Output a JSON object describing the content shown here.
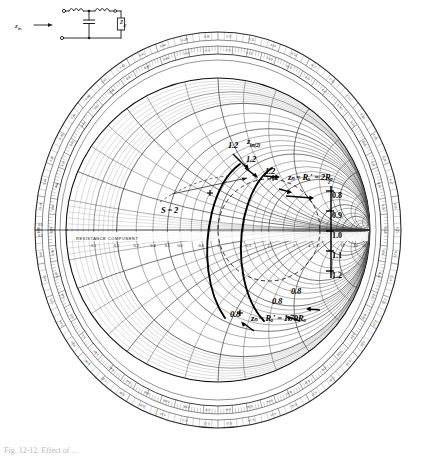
{
  "circuit": {
    "name": "two-section-lc-ladder",
    "input_label": "z",
    "input_sub": "in",
    "load_label": "z",
    "load_sub": "R",
    "components": [
      "inductor-1",
      "inductor-2",
      "capacitor-shunt",
      "load-resistor"
    ],
    "arrow": "input-direction-arrow"
  },
  "chart": {
    "type": "smith-chart",
    "title": "",
    "axis_label": "RESISTANCE COMPONENT",
    "left_rim_label_top": "0.0",
    "left_rim_label_bottom": "0.5",
    "grid_color": "#555555",
    "trace_color": "#000000",
    "rim_color": "#222222"
  },
  "annotations": {
    "swr_label": "S = 2",
    "freq_12_a": "1.2",
    "freq_12_b": "1.2",
    "freq_12_c": "1.2",
    "zin_2_label": "z",
    "zin_2_sub": "in(2)",
    "zin_2_right": "zₙ = Rₒ′ = 2Rₒ",
    "freq_08_a": "0.8",
    "freq_08_b": "0.8",
    "freq_08_c": "0.8",
    "zin_1_right": "zₙ = Rₒ′ = 1.79Rₒ",
    "zr_marker": "zᵣ"
  },
  "side_scale": {
    "name": "frequency-scale",
    "values": [
      "0.8",
      "0.9",
      "1.0",
      "1.1",
      "1.2"
    ]
  },
  "caption": {
    "text": "Fig. 12-12.  Effect of ..."
  },
  "chart_data": {
    "type": "scatter",
    "xlabel": "RESISTANCE COMPONENT",
    "ylabel": "",
    "swr_circle": 2,
    "frequency_ticks": [
      "0.8",
      "0.9",
      "1.0",
      "1.1",
      "1.2"
    ],
    "series": [
      {
        "name": "z_in(2) locus",
        "points": [
          {
            "f": "0.8",
            "label": "0.8"
          },
          {
            "f": "0.9",
            "label": ""
          },
          {
            "f": "1.0",
            "label": ""
          },
          {
            "f": "1.1",
            "label": ""
          },
          {
            "f": "1.2",
            "label": "1.2"
          }
        ],
        "endpoint_label": "z_in = R_o' = 2R_o"
      },
      {
        "name": "z_in(1) locus",
        "points": [
          {
            "f": "0.8",
            "label": "0.8"
          },
          {
            "f": "1.0",
            "label": ""
          },
          {
            "f": "1.2",
            "label": "1.2"
          }
        ],
        "endpoint_label": "z_in = R_o' = 1.79R_o"
      }
    ],
    "resistance_axis_ticks": [
      "0.1",
      "0.2",
      "0.3",
      "0.4",
      "0.5",
      "0.6",
      "0.8",
      "1",
      "1.5",
      "2",
      "3",
      "4",
      "5",
      "10",
      "20",
      "50"
    ],
    "wavelength_scale_outer": [
      "0.0",
      "0.05",
      "0.10",
      "0.15",
      "0.20",
      "0.25",
      "0.30",
      "0.35",
      "0.40",
      "0.45",
      "0.5"
    ],
    "grid": true,
    "legend": "none"
  }
}
